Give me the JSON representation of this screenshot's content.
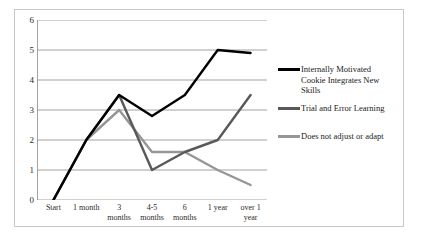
{
  "chart_data": {
    "type": "line",
    "title": "",
    "xlabel": "",
    "ylabel": "",
    "ylim": [
      0,
      6
    ],
    "yticks": [
      0,
      1,
      2,
      3,
      4,
      5,
      6
    ],
    "grid": true,
    "legend_position": "right",
    "categories": [
      "Start",
      "1 month",
      "3 months",
      "4-5 months",
      "6 months",
      "1 year",
      "over 1 year"
    ],
    "category_lines": [
      [
        "Start",
        ""
      ],
      [
        "1 month",
        ""
      ],
      [
        "3",
        "months"
      ],
      [
        "4-5",
        "months"
      ],
      [
        "6",
        "months"
      ],
      [
        "1 year",
        ""
      ],
      [
        "over 1",
        "year"
      ]
    ],
    "series": [
      {
        "name": "Internally Motivated Cookie Integrates New Skills",
        "color": "#000000",
        "values": [
          0,
          2,
          3.5,
          2.8,
          3.5,
          5,
          4.9
        ]
      },
      {
        "name": "Trial and Error Learning",
        "color": "#595959",
        "values": [
          0,
          2,
          3.5,
          1,
          1.6,
          2,
          3.5
        ]
      },
      {
        "name": "Does not adjust or adapt",
        "color": "#969696",
        "values": [
          0,
          2,
          3,
          1.6,
          1.6,
          1,
          0.5
        ]
      }
    ]
  },
  "legend": {
    "items": [
      {
        "label_lines": [
          "Internally Motivated",
          "Cookie Integrates New",
          "Skills"
        ],
        "color": "#000000"
      },
      {
        "label_lines": [
          "Trial and Error Learning"
        ],
        "color": "#595959"
      },
      {
        "label_lines": [
          "Does not adjust or adapt"
        ],
        "color": "#969696"
      }
    ]
  },
  "axis": {
    "y_labels": [
      "6",
      "5",
      "4",
      "3",
      "2",
      "1",
      "0"
    ],
    "gridline_color": "#8c8c8c",
    "frame_color": "#c8c8c8"
  }
}
